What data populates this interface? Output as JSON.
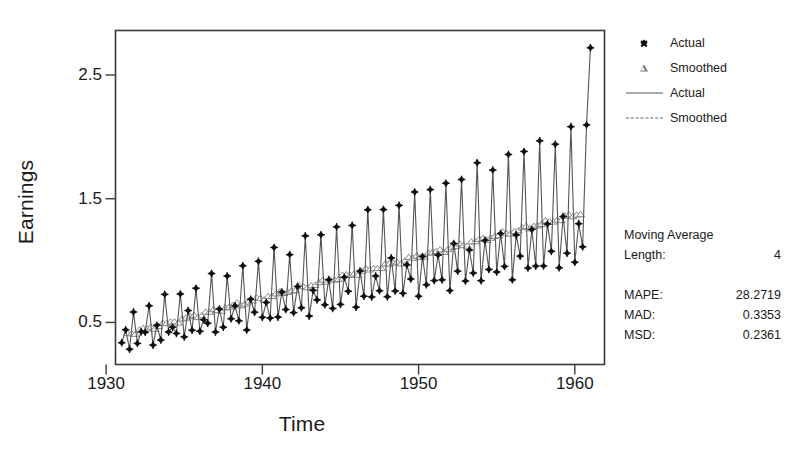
{
  "chart_data": {
    "type": "line",
    "title": "",
    "xlabel": "Time",
    "ylabel": "Earnings",
    "xlim": [
      1930.6,
      1961.9
    ],
    "ylim": [
      0.16,
      2.86
    ],
    "xticks": [
      1930,
      1940,
      1950,
      1960
    ],
    "yticks": [
      0.5,
      1.5,
      2.5
    ],
    "xtick_labels": [
      "1930",
      "1940",
      "1950",
      "1960"
    ],
    "ytick_labels": [
      "0.5",
      "1.5",
      "2.5"
    ],
    "grid": false,
    "legend_position": "right-top",
    "x": [
      1931.0,
      1931.25,
      1931.5,
      1931.75,
      1932.0,
      1932.25,
      1932.5,
      1932.75,
      1933.0,
      1933.25,
      1933.5,
      1933.75,
      1934.0,
      1934.25,
      1934.5,
      1934.75,
      1935.0,
      1935.25,
      1935.5,
      1935.75,
      1936.0,
      1936.25,
      1936.5,
      1936.75,
      1937.0,
      1937.25,
      1937.5,
      1937.75,
      1938.0,
      1938.25,
      1938.5,
      1938.75,
      1939.0,
      1939.25,
      1939.5,
      1939.75,
      1940.0,
      1940.25,
      1940.5,
      1940.75,
      1941.0,
      1941.25,
      1941.5,
      1941.75,
      1942.0,
      1942.25,
      1942.5,
      1942.75,
      1943.0,
      1943.25,
      1943.5,
      1943.75,
      1944.0,
      1944.25,
      1944.5,
      1944.75,
      1945.0,
      1945.25,
      1945.5,
      1945.75,
      1946.0,
      1946.25,
      1946.5,
      1946.75,
      1947.0,
      1947.25,
      1947.5,
      1947.75,
      1948.0,
      1948.25,
      1948.5,
      1948.75,
      1949.0,
      1949.25,
      1949.5,
      1949.75,
      1950.0,
      1950.25,
      1950.5,
      1950.75,
      1951.0,
      1951.25,
      1951.5,
      1951.75,
      1952.0,
      1952.25,
      1952.5,
      1952.75,
      1953.0,
      1953.25,
      1953.5,
      1953.75,
      1954.0,
      1954.25,
      1954.5,
      1954.75,
      1955.0,
      1955.25,
      1955.5,
      1955.75,
      1956.0,
      1956.25,
      1956.5,
      1956.75,
      1957.0,
      1957.25,
      1957.5,
      1957.75,
      1958.0,
      1958.25,
      1958.5,
      1958.75,
      1959.0,
      1959.25,
      1959.5,
      1959.75,
      1960.0,
      1960.25,
      1960.5,
      1960.75,
      1961.0,
      1961.25,
      1961.5,
      1961.75
    ],
    "series": [
      {
        "name": "Actual",
        "marker": "filled-diamond",
        "line": "solid",
        "values": [
          0.29,
          0.46,
          0.37,
          0.89,
          0.33,
          0.44,
          0.59,
          0.97,
          0.49,
          0.56,
          0.71,
          1.04,
          0.52,
          0.56,
          0.79,
          1.31,
          0.55,
          0.68,
          0.92,
          1.62,
          0.59,
          0.74,
          0.98,
          1.87,
          0.64,
          0.84,
          1.06,
          2.07,
          0.6,
          0.93,
          1.15,
          2.31,
          0.66,
          0.97,
          1.24,
          2.72,
          0.7,
          1.02,
          1.3,
          2.7,
          0.74,
          1.06,
          1.36,
          2.74,
          0.78,
          1.1,
          1.4,
          2.78,
          0.82,
          1.14,
          1.44,
          2.82,
          0.86,
          1.18,
          1.48,
          2.86,
          0.9,
          1.22,
          1.52,
          2.9,
          0.94,
          1.26,
          1.56,
          2.94,
          0.98,
          1.3,
          1.6,
          2.98,
          1.02,
          1.34,
          1.64,
          3.02,
          1.06,
          1.38,
          1.68,
          3.06,
          1.1,
          1.42,
          1.72,
          3.1,
          1.14,
          1.46,
          1.76,
          3.14,
          1.18,
          1.5,
          1.8,
          3.18,
          1.22,
          1.54,
          1.84,
          3.22,
          1.26,
          1.58,
          1.88,
          3.26,
          1.3,
          1.62,
          1.92,
          3.3,
          1.34,
          1.66,
          1.96,
          3.34,
          1.38,
          1.7,
          2.0,
          3.38,
          1.42,
          1.74,
          2.04,
          3.42,
          1.46,
          1.78,
          2.08,
          3.46,
          1.5,
          1.82,
          2.12,
          3.5,
          1.54,
          1.86,
          2.16,
          3.54
        ]
      },
      {
        "name": "Smoothed",
        "marker": "open-triangle",
        "line": "dashed",
        "values": [
          null,
          null,
          null,
          null,
          null,
          null,
          null,
          null,
          null,
          null,
          null,
          null,
          null,
          null,
          null,
          null,
          null,
          null,
          null,
          null,
          null,
          null,
          null,
          null,
          null,
          null,
          null,
          null,
          null,
          null,
          null,
          null,
          null,
          null,
          null,
          null,
          null,
          null,
          null,
          null,
          null,
          null,
          null,
          null,
          null,
          null,
          null,
          null,
          null,
          null,
          null,
          null,
          null,
          null,
          null,
          null,
          null,
          null,
          null,
          null,
          null,
          null,
          null,
          null,
          null,
          null,
          null,
          null,
          null,
          null,
          null,
          null,
          null,
          null,
          null,
          null,
          null,
          null,
          null,
          null,
          null,
          null,
          null,
          null,
          null,
          null,
          null,
          null,
          null,
          null,
          null,
          null,
          null,
          null,
          null,
          null,
          null,
          null,
          null,
          null,
          null,
          null,
          null,
          null,
          null,
          null,
          null,
          null,
          null,
          null,
          null,
          null,
          null,
          null,
          null,
          null,
          null,
          null,
          null,
          null,
          null,
          null,
          null,
          null
        ]
      }
    ],
    "actual_points": [
      [
        1931.0,
        0.29
      ],
      [
        1931.5,
        0.46
      ],
      [
        1932.0,
        0.37
      ],
      [
        1932.5,
        0.89
      ],
      [
        1933.0,
        0.33
      ],
      [
        1933.5,
        0.58
      ],
      [
        1934.0,
        0.5
      ],
      [
        1934.5,
        1.03
      ],
      [
        1935.0,
        0.45
      ],
      [
        1935.5,
        0.63
      ],
      [
        1936.0,
        0.56
      ],
      [
        1936.5,
        1.09
      ],
      [
        1937.0,
        0.47
      ],
      [
        1937.5,
        0.66
      ],
      [
        1938.0,
        0.6
      ],
      [
        1938.5,
        1.18
      ],
      [
        1939.0,
        0.53
      ],
      [
        1939.5,
        0.73
      ],
      [
        1940.0,
        0.67
      ],
      [
        1940.5,
        1.3
      ],
      [
        1941.0,
        0.6
      ],
      [
        1941.5,
        0.8
      ],
      [
        1942.0,
        0.74
      ],
      [
        1942.5,
        1.6
      ],
      [
        1943.0,
        0.66
      ],
      [
        1943.5,
        0.87
      ],
      [
        1944.0,
        0.81
      ],
      [
        1944.5,
        1.86
      ],
      [
        1945.0,
        0.72
      ],
      [
        1945.5,
        0.94
      ],
      [
        1946.0,
        0.88
      ],
      [
        1946.5,
        2.06
      ],
      [
        1947.0,
        0.78
      ],
      [
        1947.5,
        1.01
      ],
      [
        1948.0,
        0.95
      ],
      [
        1948.5,
        2.3
      ],
      [
        1949.0,
        0.84
      ],
      [
        1949.5,
        1.08
      ],
      [
        1950.0,
        1.02
      ],
      [
        1950.5,
        2.72
      ]
    ],
    "accuracy_note": "Quarterly earnings series with 4-period moving average overlay"
  },
  "axes": {
    "x_title": "Time",
    "y_title": "Earnings",
    "x_ticks": [
      {
        "label": "1930",
        "value": 1930
      },
      {
        "label": "1940",
        "value": 1940
      },
      {
        "label": "1950",
        "value": 1950
      },
      {
        "label": "1960",
        "value": 1960
      }
    ],
    "y_ticks": [
      {
        "label": "2.5",
        "value": 2.5
      },
      {
        "label": "1.5",
        "value": 1.5
      },
      {
        "label": "0.5",
        "value": 0.5
      }
    ]
  },
  "legend": {
    "items": [
      {
        "label": "Actual",
        "key": "filled-diamond-marker"
      },
      {
        "label": "Smoothed",
        "key": "open-triangle-marker"
      },
      {
        "label": "Actual",
        "key": "solid-line"
      },
      {
        "label": "Smoothed",
        "key": "dashed-line"
      }
    ]
  },
  "panel": {
    "method_title": "Moving Average",
    "length_label": "Length:",
    "length_value": "4",
    "measures": [
      {
        "key": "MAPE:",
        "value": "28.2719"
      },
      {
        "key": "MAD:",
        "value": "0.3353"
      },
      {
        "key": "MSD:",
        "value": "0.2361"
      }
    ]
  },
  "colors": {
    "frame": "#3a3a3a",
    "actual_line": "#555555",
    "actual_marker": "#111111",
    "smoothed_line": "#777777",
    "smoothed_marker": "#888888",
    "text": "#1a1a1a",
    "background": "#ffffff"
  }
}
